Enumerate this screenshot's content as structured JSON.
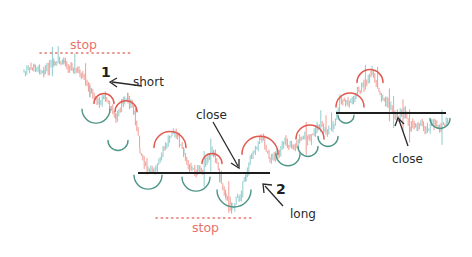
{
  "colors": {
    "bull": "#7fc4c4",
    "bear": "#ef8a82",
    "arc_top": "#e05a50",
    "arc_bottom": "#4f9688",
    "level": "#1e1e1e",
    "stop": "#e8726b",
    "arrow": "#2a2a2a",
    "text": "#2a2a2a"
  },
  "labels": {
    "stop_top": "stop",
    "stop_bottom": "stop",
    "num1": "1",
    "short": "short",
    "close1": "close",
    "num2": "2",
    "long": "long",
    "close2": "close"
  },
  "chart_data": {
    "type": "line",
    "title": "",
    "xlabel": "",
    "ylabel": "",
    "grid": false,
    "price_path": [
      [
        24,
        72
      ],
      [
        34,
        68
      ],
      [
        44,
        70
      ],
      [
        54,
        64
      ],
      [
        64,
        62
      ],
      [
        72,
        68
      ],
      [
        80,
        74
      ],
      [
        90,
        92
      ],
      [
        98,
        102
      ],
      [
        104,
        96
      ],
      [
        110,
        108
      ],
      [
        116,
        118
      ],
      [
        122,
        104
      ],
      [
        128,
        98
      ],
      [
        134,
        112
      ],
      [
        140,
        150
      ],
      [
        148,
        172
      ],
      [
        156,
        168
      ],
      [
        164,
        150
      ],
      [
        172,
        130
      ],
      [
        178,
        138
      ],
      [
        184,
        156
      ],
      [
        192,
        170
      ],
      [
        200,
        172
      ],
      [
        208,
        160
      ],
      [
        214,
        150
      ],
      [
        220,
        178
      ],
      [
        226,
        196
      ],
      [
        232,
        208
      ],
      [
        240,
        194
      ],
      [
        246,
        174
      ],
      [
        254,
        148
      ],
      [
        262,
        136
      ],
      [
        270,
        160
      ],
      [
        278,
        152
      ],
      [
        286,
        142
      ],
      [
        294,
        148
      ],
      [
        302,
        136
      ],
      [
        310,
        140
      ],
      [
        318,
        124
      ],
      [
        326,
        132
      ],
      [
        334,
        126
      ],
      [
        340,
        100
      ],
      [
        348,
        104
      ],
      [
        356,
        96
      ],
      [
        364,
        84
      ],
      [
        372,
        74
      ],
      [
        380,
        96
      ],
      [
        388,
        104
      ],
      [
        396,
        116
      ],
      [
        404,
        112
      ],
      [
        410,
        126
      ],
      [
        418,
        124
      ],
      [
        426,
        128
      ],
      [
        434,
        124
      ],
      [
        442,
        126
      ],
      [
        448,
        122
      ]
    ],
    "levels": [
      {
        "name": "support/resistance 1",
        "x1": 138,
        "x2": 270,
        "y": 173
      },
      {
        "name": "support/resistance 2",
        "x1": 336,
        "x2": 446,
        "y": 113
      }
    ],
    "stops": [
      {
        "label": "stop",
        "x1": 40,
        "x2": 130,
        "y": 53,
        "text_x": 70,
        "text_y": 40
      },
      {
        "label": "stop",
        "x1": 156,
        "x2": 254,
        "y": 218,
        "text_x": 192,
        "text_y": 223
      }
    ],
    "swing_highs": [
      {
        "cx": 104,
        "cy": 100,
        "r": 10
      },
      {
        "cx": 126,
        "cy": 108,
        "r": 11
      },
      {
        "cx": 170,
        "cy": 142,
        "r": 16
      },
      {
        "cx": 212,
        "cy": 160,
        "r": 10
      },
      {
        "cx": 260,
        "cy": 148,
        "r": 18
      },
      {
        "cx": 310,
        "cy": 134,
        "r": 14
      },
      {
        "cx": 350,
        "cy": 102,
        "r": 14
      },
      {
        "cx": 370,
        "cy": 78,
        "r": 13
      }
    ],
    "swing_lows": [
      {
        "cx": 96,
        "cy": 114,
        "r": 14
      },
      {
        "cx": 118,
        "cy": 144,
        "r": 10
      },
      {
        "cx": 148,
        "cy": 180,
        "r": 14
      },
      {
        "cx": 196,
        "cy": 182,
        "r": 14
      },
      {
        "cx": 234,
        "cy": 196,
        "r": 17
      },
      {
        "cx": 288,
        "cy": 158,
        "r": 12
      },
      {
        "cx": 308,
        "cy": 150,
        "r": 10
      },
      {
        "cx": 328,
        "cy": 140,
        "r": 10
      },
      {
        "cx": 346,
        "cy": 118,
        "r": 8
      },
      {
        "cx": 440,
        "cy": 122,
        "r": 10
      }
    ],
    "annotations": [
      {
        "text": "1",
        "role": "entry number"
      },
      {
        "text": "short",
        "role": "entry 1 direction"
      },
      {
        "text": "close",
        "role": "exit of entry 1"
      },
      {
        "text": "2",
        "role": "entry number"
      },
      {
        "text": "long",
        "role": "entry 2 direction"
      },
      {
        "text": "close",
        "role": "exit of entry 2"
      },
      {
        "text": "stop",
        "role": "stop above entry 1"
      },
      {
        "text": "stop",
        "role": "stop below entry 2"
      }
    ]
  }
}
